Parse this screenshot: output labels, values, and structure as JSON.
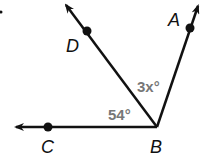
{
  "diagram": {
    "points": {
      "A": "A",
      "B": "B",
      "C": "C",
      "D": "D"
    },
    "angles": {
      "CBD": "54°",
      "DBA": "3x°"
    },
    "colors": {
      "line": "#111111",
      "angle_label": "#777777"
    }
  }
}
